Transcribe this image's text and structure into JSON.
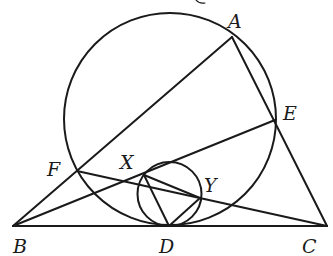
{
  "diagram": {
    "stroke_color": "#1a1a1a",
    "points": {
      "A": {
        "label": "A",
        "x": 232,
        "y": 37
      },
      "B": {
        "label": "B",
        "x": 13,
        "y": 226
      },
      "C": {
        "label": "C",
        "x": 327,
        "y": 226
      },
      "D": {
        "label": "D",
        "x": 169,
        "y": 226
      },
      "E": {
        "label": "E",
        "x": 275,
        "y": 120
      },
      "F": {
        "label": "F",
        "x": 77,
        "y": 171
      },
      "X": {
        "label": "X",
        "x": 144,
        "y": 175
      },
      "Y": {
        "label": "Y",
        "x": 200,
        "y": 198
      }
    },
    "circles": [
      {
        "name": "big-circle",
        "cx": 170,
        "cy": 119,
        "r": 106
      },
      {
        "name": "small-circle",
        "cx": 169.5,
        "cy": 194,
        "r": 32
      }
    ],
    "segments": [
      [
        "B",
        "C"
      ],
      [
        "B",
        "A"
      ],
      [
        "A",
        "C"
      ],
      [
        "B",
        "E"
      ],
      [
        "F",
        "C"
      ],
      [
        "X",
        "D"
      ],
      [
        "D",
        "Y"
      ],
      [
        "X",
        "Y"
      ]
    ]
  }
}
